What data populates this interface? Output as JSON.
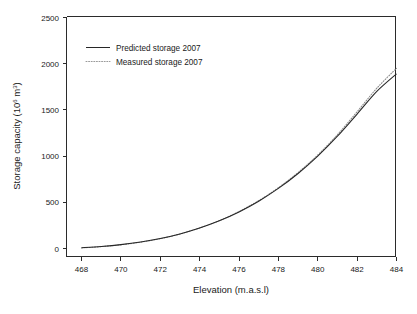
{
  "chart_data": {
    "type": "line",
    "title": "",
    "xlabel": "Elevation (m.a.s.l)",
    "ylabel_main": "Storage capacity (10",
    "ylabel_sup1": "6",
    "ylabel_mid": " m",
    "ylabel_sup2": "3",
    "ylabel_end": ")",
    "ylabel_plain": "Storage capacity (10^6 m^3)",
    "xlim": [
      467.2,
      484.8
    ],
    "ylim": [
      0,
      2500
    ],
    "xticks": [
      468,
      470,
      472,
      474,
      476,
      478,
      480,
      482,
      484
    ],
    "yticks": [
      0,
      500,
      1000,
      1500,
      2000,
      2500
    ],
    "xtick_labels": [
      "468",
      "470",
      "472",
      "474",
      "476",
      "478",
      "480",
      "482",
      "484"
    ],
    "ytick_labels": [
      "0",
      "500",
      "1000",
      "1500",
      "2000",
      "2500"
    ],
    "grid": false,
    "legend_position": "upper-left-inside",
    "x": [
      468,
      469,
      470,
      471,
      472,
      473,
      474,
      475,
      476,
      477,
      478,
      479,
      480,
      481,
      482,
      483,
      484
    ],
    "series": [
      {
        "name": "Predicted storage 2007",
        "style": "solid",
        "color": "#272727",
        "values": [
          8,
          22,
          42,
          70,
          108,
          158,
          222,
          300,
          396,
          512,
          650,
          812,
          1000,
          1215,
          1455,
          1700,
          1890
        ]
      },
      {
        "name": "Measured storage 2007",
        "style": "dotted",
        "color": "#8a8a8a",
        "values": [
          6,
          20,
          40,
          68,
          106,
          157,
          222,
          302,
          400,
          518,
          658,
          822,
          1012,
          1232,
          1480,
          1735,
          1950
        ]
      }
    ]
  },
  "legend": {
    "items": [
      {
        "label": "Predicted storage 2007",
        "style": "solid"
      },
      {
        "label": "Measured storage 2007",
        "style": "dotted"
      }
    ]
  },
  "caption": {
    "text": ""
  }
}
